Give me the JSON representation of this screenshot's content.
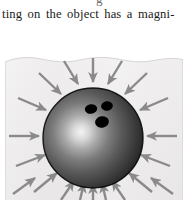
{
  "page": {
    "width": 188,
    "height": 200,
    "background_color": "#ffffff",
    "kind": "textbook-page-fragment"
  },
  "text": {
    "partial_line_above": "g",
    "body_line": "ting on the object has a magni-",
    "body_line_color": "#1b1b1b",
    "font_style": "serif"
  },
  "figure": {
    "caption": "",
    "panel_background_color": "#eeecec",
    "panel_border_color": "#d9d7d7",
    "top_edge_style": "torn-wavy",
    "concept": "uniform inward pressure on a submerged sphere",
    "ball": {
      "center_x": 88,
      "center_y": 84,
      "radius": 50,
      "surface_color_dark": "#111111",
      "surface_color_mid": "#4a4a4a",
      "highlight_color": "#f2f2f2",
      "highlight_x": 70,
      "highlight_y": 80,
      "outline_color": "#000000",
      "finger_holes": [
        {
          "cx": 86,
          "cy": 55,
          "rx": 6.2,
          "ry": 4.6,
          "color": "#000000",
          "label": "finger-hole-left"
        },
        {
          "cx": 102,
          "cy": 52,
          "rx": 5.8,
          "ry": 4.6,
          "color": "#000000",
          "label": "finger-hole-right"
        },
        {
          "cx": 97,
          "cy": 68,
          "rx": 6.8,
          "ry": 5.6,
          "color": "#000000",
          "label": "thumb-hole"
        }
      ]
    },
    "arrows": {
      "count": 20,
      "direction": "inward",
      "color": "#8a8a8a",
      "shaft_width": 2.4,
      "head_length": 7,
      "meaning": "pressure forces acting perpendicular to the surface",
      "angles_deg": [
        90,
        108,
        126,
        144,
        162,
        180,
        198,
        216,
        234,
        252,
        270,
        288,
        306,
        324,
        342,
        0,
        18,
        36,
        54,
        72
      ]
    }
  }
}
